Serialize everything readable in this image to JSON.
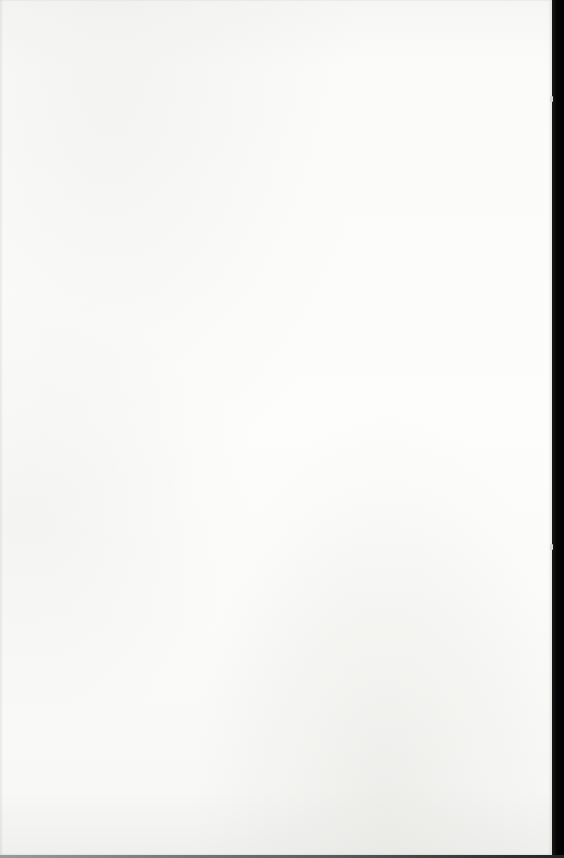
{
  "document": {
    "page_color": "#fcfcfb",
    "scan_edge_color": "#000000",
    "text_content": ""
  }
}
